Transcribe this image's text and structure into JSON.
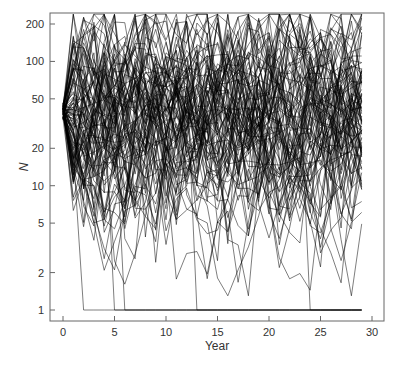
{
  "chart_data": {
    "type": "line",
    "title": "",
    "xlabel": "Year",
    "ylabel": "N",
    "yscale": "log",
    "xlim": [
      -1,
      31
    ],
    "ylim": [
      0.8,
      240
    ],
    "xticks": [
      0,
      5,
      10,
      15,
      20,
      25,
      30
    ],
    "xtick_labels": [
      "0",
      "5",
      "10",
      "15",
      "20",
      "25",
      "30"
    ],
    "yticks": [
      1,
      2,
      5,
      10,
      20,
      50,
      100,
      200
    ],
    "ytick_labels": [
      "1",
      "2",
      "5",
      "10",
      "20",
      "50",
      "100",
      "200"
    ],
    "grid": false,
    "legend": null,
    "series_summary": {
      "n_trajectories": 100,
      "start_value": 40,
      "years": [
        0,
        29
      ],
      "typical_range": [
        5,
        150
      ],
      "max_observed": 240,
      "extinction_floor": 1,
      "extinction_years": [
        2,
        5,
        6,
        13,
        24
      ]
    },
    "line_color": "#000000"
  }
}
